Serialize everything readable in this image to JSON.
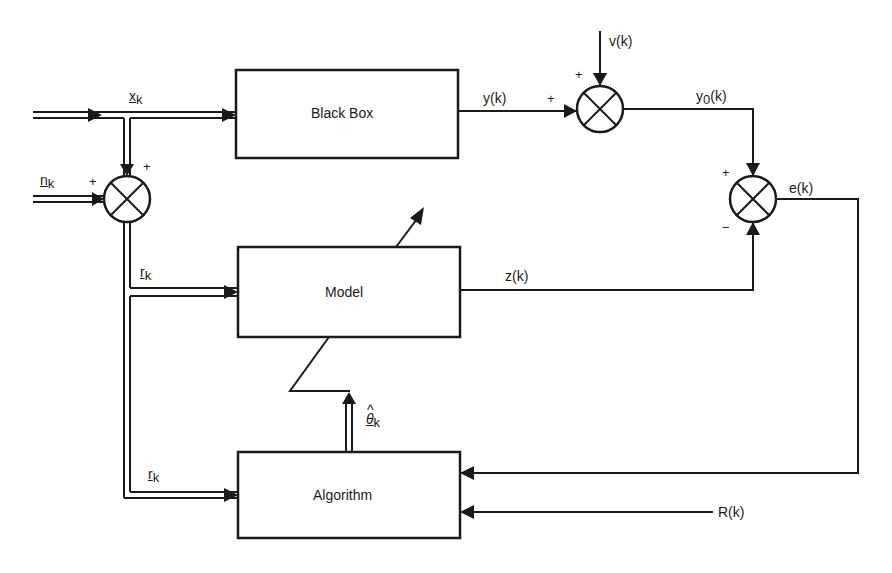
{
  "diagram": {
    "type": "block-diagram",
    "blocks": {
      "black_box": "Black Box",
      "model": "Model",
      "algorithm": "Algorithm"
    },
    "signals": {
      "x_k": {
        "base": "x",
        "sub": "k"
      },
      "n_k": {
        "base": "n",
        "sub": "k"
      },
      "r_k_model": {
        "base": "r",
        "sub": "k"
      },
      "r_k_alg": {
        "base": "r",
        "sub": "k"
      },
      "theta_k": {
        "hat": "^",
        "base": "θ",
        "sub": "k"
      },
      "y_k": "y(k)",
      "v_k": "v(k)",
      "y0_k": {
        "base": "y",
        "sub": "0",
        "tail": "(k)"
      },
      "e_k": "e(k)",
      "z_k": "z(k)",
      "R_k": "R(k)"
    },
    "signs": {
      "sum_left_top": "+",
      "sum_left_left": "+",
      "sum_noise_top": "+",
      "sum_noise_left": "+",
      "sum_error_top": "+",
      "sum_error_bottom": "−"
    }
  },
  "colors": {
    "line": "#1a1a1a",
    "background": "#ffffff"
  }
}
